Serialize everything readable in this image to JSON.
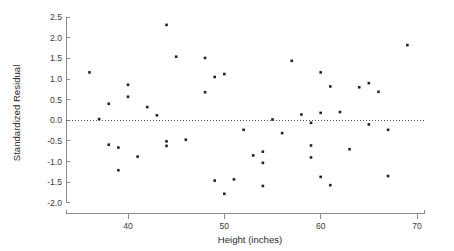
{
  "chart_data": {
    "type": "scatter",
    "title": "",
    "xlabel": "Height (inches)",
    "ylabel": "Standardized Residual",
    "xlim": [
      34.5,
      70.5
    ],
    "ylim": [
      -2.0,
      2.5
    ],
    "xticks": [
      40,
      50,
      60,
      70
    ],
    "xtick_labels": [
      "40",
      "50",
      "60",
      "70"
    ],
    "yticks": [
      2.5,
      2.0,
      1.5,
      1.0,
      0.5,
      0.0,
      -0.5,
      -1.0,
      -1.5,
      -2.0
    ],
    "ytick_labels": [
      "2.5",
      "2.0",
      "1.5",
      "1.0",
      "0.5",
      "0.0",
      "-0.5",
      "-1.0",
      "-1.5",
      "-2.0"
    ],
    "grid": false,
    "legend": null,
    "reference_line": {
      "orientation": "horizontal",
      "value": 0.0,
      "style": "dotted",
      "color": "#555555"
    },
    "marker": {
      "shape": "square",
      "size": 2.6,
      "color": "#222222"
    },
    "n_points": 53,
    "points": [
      {
        "x": 36.0,
        "y": 1.16
      },
      {
        "x": 37.0,
        "y": 0.03
      },
      {
        "x": 38.0,
        "y": 0.4
      },
      {
        "x": 38.0,
        "y": -0.59
      },
      {
        "x": 39.0,
        "y": -0.66
      },
      {
        "x": 39.0,
        "y": -1.21
      },
      {
        "x": 40.0,
        "y": 0.86
      },
      {
        "x": 40.0,
        "y": 0.57
      },
      {
        "x": 41.0,
        "y": -0.88
      },
      {
        "x": 42.0,
        "y": 0.32
      },
      {
        "x": 43.0,
        "y": 0.12
      },
      {
        "x": 44.0,
        "y": 2.31
      },
      {
        "x": 44.0,
        "y": -0.51
      },
      {
        "x": 44.0,
        "y": -0.62
      },
      {
        "x": 45.0,
        "y": 1.54
      },
      {
        "x": 46.0,
        "y": -0.47
      },
      {
        "x": 48.0,
        "y": 1.51
      },
      {
        "x": 48.0,
        "y": 0.68
      },
      {
        "x": 49.0,
        "y": 1.05
      },
      {
        "x": 49.0,
        "y": -1.46
      },
      {
        "x": 50.0,
        "y": 1.12
      },
      {
        "x": 50.0,
        "y": -1.78
      },
      {
        "x": 51.0,
        "y": -1.43
      },
      {
        "x": 52.0,
        "y": -0.23
      },
      {
        "x": 53.0,
        "y": -0.85
      },
      {
        "x": 54.0,
        "y": -0.76
      },
      {
        "x": 54.0,
        "y": -1.03
      },
      {
        "x": 54.0,
        "y": -1.59
      },
      {
        "x": 55.0,
        "y": 0.02
      },
      {
        "x": 56.0,
        "y": -0.31
      },
      {
        "x": 57.0,
        "y": 1.44
      },
      {
        "x": 58.0,
        "y": 0.14
      },
      {
        "x": 59.0,
        "y": -0.06
      },
      {
        "x": 59.0,
        "y": -0.61
      },
      {
        "x": 59.0,
        "y": -0.9
      },
      {
        "x": 60.0,
        "y": 1.16
      },
      {
        "x": 60.0,
        "y": 0.18
      },
      {
        "x": 60.0,
        "y": -1.37
      },
      {
        "x": 61.0,
        "y": 0.82
      },
      {
        "x": 61.0,
        "y": -1.57
      },
      {
        "x": 62.0,
        "y": 0.2
      },
      {
        "x": 63.0,
        "y": -0.7
      },
      {
        "x": 64.0,
        "y": 0.8
      },
      {
        "x": 65.0,
        "y": 0.9
      },
      {
        "x": 65.0,
        "y": -0.1
      },
      {
        "x": 66.0,
        "y": 0.69
      },
      {
        "x": 67.0,
        "y": -0.23
      },
      {
        "x": 67.0,
        "y": -1.35
      },
      {
        "x": 69.0,
        "y": 1.82
      }
    ]
  }
}
